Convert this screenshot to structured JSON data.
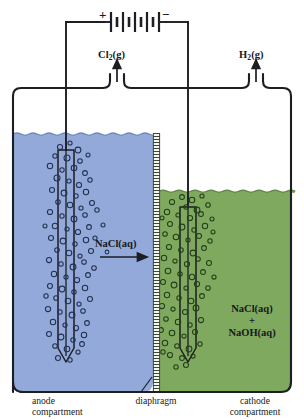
{
  "diagram": {
    "type": "labeled-schematic",
    "colors": {
      "anode_solution": "#93a9da",
      "cathode_solution": "#7fa95e",
      "outline": "#1d1d24",
      "diaphragm": "#3c4a2c",
      "bubble_anode": "#22304f",
      "bubble_cathode": "#2c4420",
      "background": "#ffffff"
    },
    "power_source": {
      "name": "battery",
      "positive_sign": "+",
      "negative_sign": "−",
      "cells": 4
    },
    "gas_outlets": [
      {
        "name": "chlorine-outlet",
        "label": "Cl",
        "subscript": "2",
        "state": "(g)",
        "full": "Cl2(g)",
        "side": "left"
      },
      {
        "name": "hydrogen-outlet",
        "label": "H",
        "subscript": "2",
        "state": "(g)",
        "full": "H2(g)",
        "side": "right"
      }
    ],
    "flow": {
      "label": "NaCl",
      "subscript": "",
      "state": "(aq)",
      "full": "NaCl(aq)",
      "direction": "right"
    },
    "cathode_solution_lines": [
      "NaCl(aq)",
      "+",
      "NaOH(aq)"
    ],
    "captions": [
      {
        "name": "anode-caption",
        "line1": "anode",
        "line2": "compartment"
      },
      {
        "name": "diaphragm-caption",
        "line1": "diaphragm",
        "line2": ""
      },
      {
        "name": "cathode-caption",
        "line1": "cathode",
        "line2": "compartment"
      }
    ]
  }
}
